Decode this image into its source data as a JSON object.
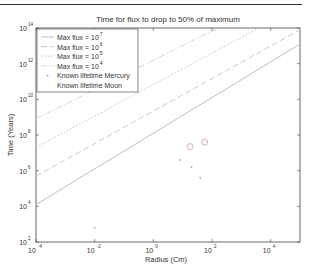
{
  "chart_data": {
    "type": "line",
    "title": "Time for flux to drop to 50% of maximum",
    "xlabel": "Radius (Cm)",
    "ylabel": "Time (Years)",
    "xscale": "log",
    "yscale": "log",
    "xlim": [
      0.0001,
      100000
    ],
    "ylim": [
      100,
      100000000000000
    ],
    "x_ticks": [
      {
        "base": "10",
        "exp": "-4",
        "value": -4
      },
      {
        "base": "10",
        "exp": "-2",
        "value": -2
      },
      {
        "base": "10",
        "exp": "0",
        "value": 0
      },
      {
        "base": "10",
        "exp": "2",
        "value": 2
      },
      {
        "base": "10",
        "exp": "4",
        "value": 4
      }
    ],
    "y_ticks": [
      {
        "base": "10",
        "exp": "14",
        "value": 14
      },
      {
        "base": "10",
        "exp": "12",
        "value": 12
      },
      {
        "base": "10",
        "exp": "10",
        "value": 10
      },
      {
        "base": "10",
        "exp": "8",
        "value": 8
      },
      {
        "base": "10",
        "exp": "6",
        "value": 6
      },
      {
        "base": "10",
        "exp": "4",
        "value": 4
      },
      {
        "base": "10",
        "exp": "2",
        "value": 2
      }
    ],
    "grid": false,
    "legend_position": "upper left",
    "series": [
      {
        "name": "Max flux = 10^7",
        "label": "Max flux = 10",
        "exp": "7",
        "style": "solid",
        "color": "#b8c0c8",
        "log_x": [
          -4,
          5
        ],
        "log_y": [
          4.1,
          13.1
        ]
      },
      {
        "name": "Max flux = 10^6",
        "label": "Max flux = 10",
        "exp": "6",
        "style": "dashed",
        "color": "#c8d0c0",
        "log_x": [
          -4,
          5
        ],
        "log_y": [
          5.7,
          13.9
        ]
      },
      {
        "name": "Max flux = 10^5",
        "label": "Max flux = 10",
        "exp": "5",
        "style": "dotted",
        "color": "#cbbfc8",
        "log_x": [
          -4,
          3.6
        ],
        "log_y": [
          7.3,
          14
        ]
      },
      {
        "name": "Max flux = 10^4",
        "label": "Max flux = 10",
        "exp": "4",
        "style": "dashdot",
        "color": "#d6d6e0",
        "log_x": [
          -4,
          2.2
        ],
        "log_y": [
          8.9,
          14
        ]
      }
    ],
    "markers": [
      {
        "name": "Known lifetime Mercury",
        "style": "point",
        "color": "#b0b0c8",
        "points": [
          {
            "log_x": 0.9,
            "log_y": 6.6
          },
          {
            "log_x": 1.3,
            "log_y": 6.2
          },
          {
            "log_x": 1.6,
            "log_y": 5.6
          },
          {
            "log_x": -2.0,
            "log_y": 2.8
          }
        ]
      },
      {
        "name": "Known lifetime Moon",
        "style": "circle",
        "color": "#c8a0a8",
        "points": [
          {
            "log_x": 1.25,
            "log_y": 7.35
          },
          {
            "log_x": 1.75,
            "log_y": 7.6
          }
        ]
      }
    ]
  },
  "legend": {
    "items": [
      {
        "text": "Max flux = 10",
        "sup": "7"
      },
      {
        "text": "Max flux = 10",
        "sup": "6"
      },
      {
        "text": "Max flux = 10",
        "sup": "5"
      },
      {
        "text": "Max flux = 10",
        "sup": "4"
      },
      {
        "text": "Known lifetime Mercury",
        "sup": ""
      },
      {
        "text": "Known lifetime Moon",
        "sup": ""
      }
    ]
  }
}
